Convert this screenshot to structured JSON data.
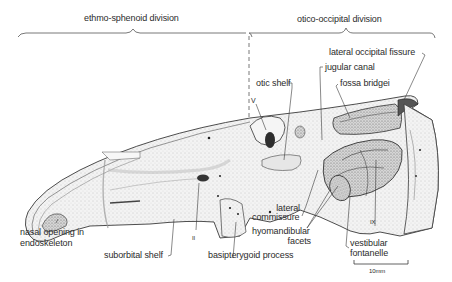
{
  "figure": {
    "divisions": {
      "left": "ethmo-sphenoid division",
      "right": "otico-occipital division"
    },
    "labels": {
      "lateral_occipital_fissure": "lateral occipital fissure",
      "jugular_canal": "jugular canal",
      "otic_shelf": "otic shelf",
      "fossa_bridgei": "fossa bridgei",
      "nerve_v": "V",
      "nasal_opening_line1": "nasal opening in",
      "nasal_opening_line2": "endoskeleton",
      "suborbital_shelf": "suborbital shelf",
      "nerve_ii": "II",
      "basipterygoid_process": "basipterygoid process",
      "lateral_commissure_line1": "lateral",
      "lateral_commissure_line2": "commissure",
      "hyomandibular_line1": "hyomandibular",
      "hyomandibular_line2": "facets",
      "nerve_ix": "IX",
      "vestibular_line1": "vestibular",
      "vestibular_line2": "fontanelle"
    },
    "scale_bar": {
      "label": "10mm"
    },
    "colors": {
      "ink": "#2b2b2b",
      "bone_light": "#efefef",
      "bone_mid": "#d4d4d4",
      "bone_dark": "#8a8a8a",
      "background": "#ffffff"
    }
  }
}
